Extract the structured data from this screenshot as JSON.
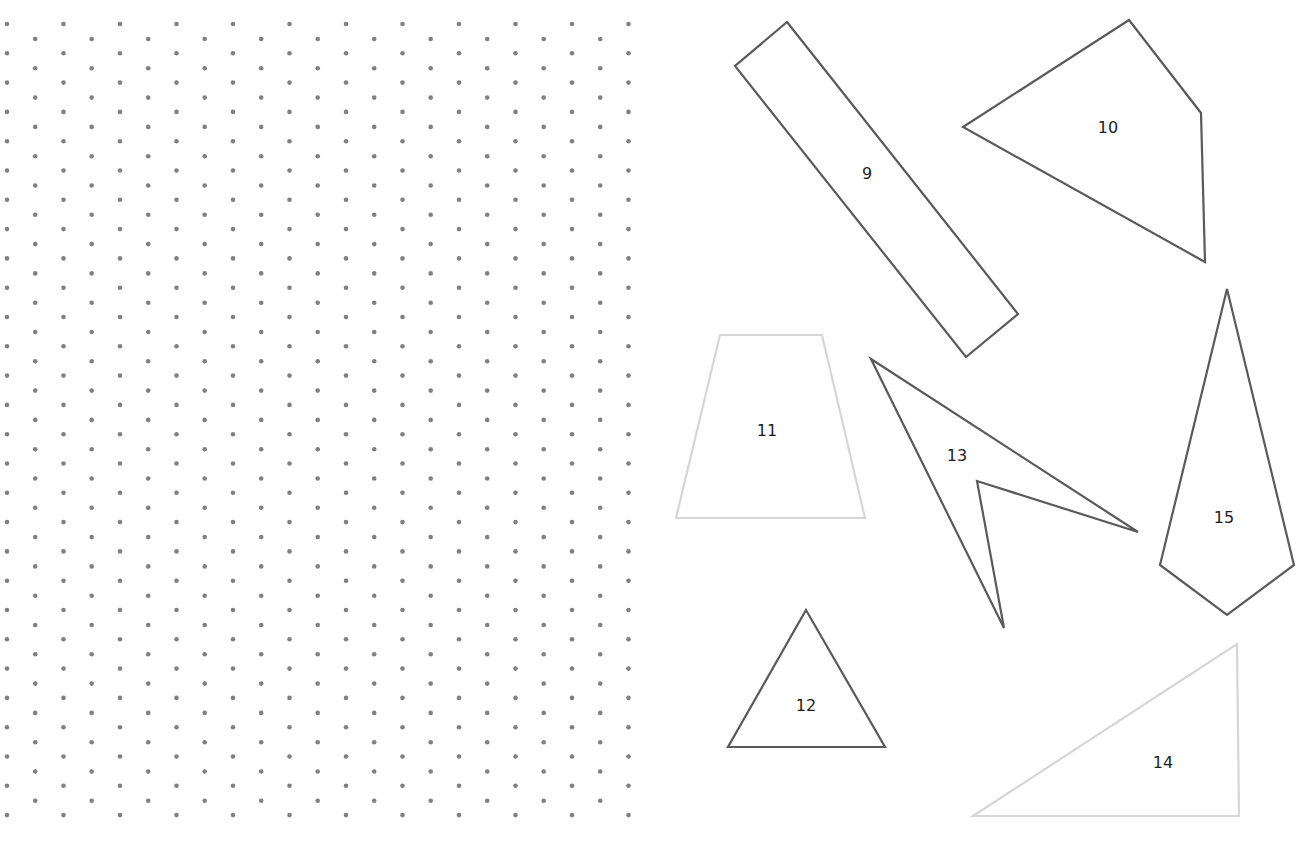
{
  "canvas": {
    "width": 1307,
    "height": 846,
    "background": "#ffffff"
  },
  "dot_grid": {
    "type": "isometric",
    "color": "#808080",
    "radius": 2.3,
    "origin_a": {
      "x": 7,
      "y": 24
    },
    "origin_b": {
      "x": 35.2,
      "y": 39
    },
    "col_pitch": 56.5,
    "row_pitch": 29.3,
    "cols_a": 12,
    "cols_b": 11,
    "rows_a": 28,
    "rows_b": 27
  },
  "colors": {
    "dark_stroke": "#5a5a5a",
    "light_stroke": "#d6d6d6",
    "label": "#1e1e1e"
  },
  "shapes": [
    {
      "id": "9",
      "label": "9",
      "stroke": "dark",
      "points": [
        [
          787,
          22
        ],
        [
          1018,
          314
        ],
        [
          966,
          357
        ],
        [
          735,
          66
        ]
      ],
      "label_pos": [
        867,
        179
      ]
    },
    {
      "id": "10",
      "label": "10",
      "stroke": "dark",
      "points": [
        [
          1129,
          20
        ],
        [
          1201,
          113
        ],
        [
          1205,
          262
        ],
        [
          963,
          127
        ]
      ],
      "label_pos": [
        1108,
        133
      ]
    },
    {
      "id": "11",
      "label": "11",
      "stroke": "light",
      "points": [
        [
          720,
          335
        ],
        [
          822,
          335
        ],
        [
          865,
          518
        ],
        [
          676,
          518
        ]
      ],
      "label_pos": [
        767,
        436
      ]
    },
    {
      "id": "12",
      "label": "12",
      "stroke": "dark",
      "points": [
        [
          806,
          610
        ],
        [
          885,
          747
        ],
        [
          728,
          747
        ]
      ],
      "label_pos": [
        806,
        711
      ]
    },
    {
      "id": "13",
      "label": "13",
      "stroke": "dark",
      "points": [
        [
          871,
          359
        ],
        [
          1138,
          532
        ],
        [
          977,
          481
        ],
        [
          1004,
          628
        ]
      ],
      "label_pos": [
        957,
        461
      ]
    },
    {
      "id": "14",
      "label": "14",
      "stroke": "light",
      "points": [
        [
          1237,
          644
        ],
        [
          1239,
          816
        ],
        [
          973,
          816
        ]
      ],
      "label_pos": [
        1163,
        768
      ]
    },
    {
      "id": "15",
      "label": "15",
      "stroke": "dark",
      "points": [
        [
          1227,
          289
        ],
        [
          1294,
          565
        ],
        [
          1227,
          615
        ],
        [
          1160,
          565
        ]
      ],
      "label_pos": [
        1224,
        523
      ]
    }
  ]
}
